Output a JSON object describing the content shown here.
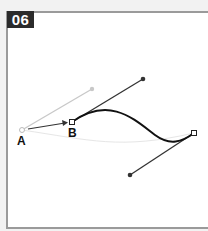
{
  "step": {
    "number": "06"
  },
  "labels": {
    "a": "A",
    "b": "B"
  },
  "colors": {
    "curve": "#111111",
    "handle": "#333333",
    "ghost": "#c8c8c8",
    "badge": "#2b2b2b"
  },
  "diagram": {
    "anchor_a": [
      22,
      130
    ],
    "anchor_b": [
      72,
      122
    ],
    "anchor_end": [
      194,
      133
    ]
  }
}
